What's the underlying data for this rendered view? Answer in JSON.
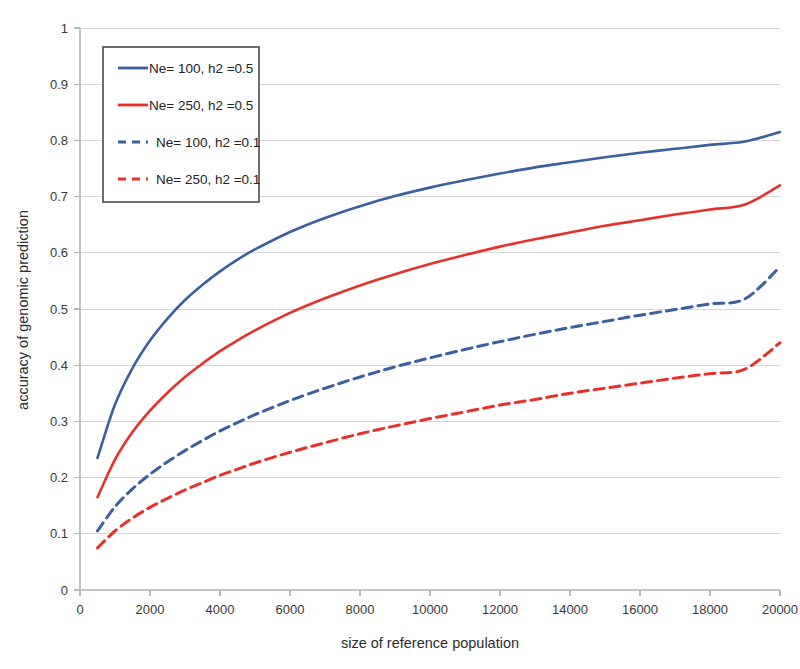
{
  "chart_data": {
    "type": "line",
    "title": "",
    "xlabel": "size of reference population",
    "ylabel": "accuracy of genomic prediction",
    "xlim": [
      0,
      20000
    ],
    "ylim": [
      0,
      1
    ],
    "grid": true,
    "legend_position": "top-left",
    "x_ticks": [
      "0",
      "2000",
      "4000",
      "6000",
      "8000",
      "10000",
      "12000",
      "14000",
      "16000",
      "18000",
      "20000"
    ],
    "y_ticks": [
      "0",
      "0.1",
      "0.2",
      "0.3",
      "0.4",
      "0.5",
      "0.6",
      "0.7",
      "0.8",
      "0.9",
      "1"
    ],
    "x": [
      500,
      1000,
      1500,
      2000,
      2500,
      3000,
      3500,
      4000,
      4500,
      5000,
      6000,
      7000,
      8000,
      9000,
      10000,
      11000,
      12000,
      13000,
      14000,
      15000,
      16000,
      17000,
      18000,
      19000,
      20000
    ],
    "series": [
      {
        "name": "Ne= 100, h2 =0.5",
        "color": "#3c5f9e",
        "style": "solid",
        "values": [
          0.235,
          0.33,
          0.395,
          0.444,
          0.483,
          0.516,
          0.543,
          0.567,
          0.588,
          0.606,
          0.637,
          0.662,
          0.683,
          0.701,
          0.716,
          0.729,
          0.741,
          0.752,
          0.761,
          0.77,
          0.778,
          0.785,
          0.792,
          0.798,
          0.815
        ]
      },
      {
        "name": "Ne= 250, h2 =0.5",
        "color": "#e8302a",
        "style": "solid",
        "values": [
          0.165,
          0.232,
          0.281,
          0.319,
          0.351,
          0.379,
          0.403,
          0.425,
          0.444,
          0.462,
          0.493,
          0.519,
          0.542,
          0.562,
          0.58,
          0.596,
          0.611,
          0.624,
          0.636,
          0.648,
          0.658,
          0.668,
          0.677,
          0.686,
          0.72
        ]
      },
      {
        "name": "Ne= 100, h2 =0.1",
        "color": "#3c5f9e",
        "style": "dashed",
        "values": [
          0.105,
          0.148,
          0.18,
          0.206,
          0.228,
          0.248,
          0.266,
          0.283,
          0.298,
          0.312,
          0.337,
          0.359,
          0.379,
          0.397,
          0.413,
          0.428,
          0.442,
          0.455,
          0.467,
          0.478,
          0.489,
          0.499,
          0.509,
          0.518,
          0.575
        ]
      },
      {
        "name": "Ne= 250, h2 =0.1",
        "color": "#e8302a",
        "style": "dashed",
        "values": [
          0.075,
          0.105,
          0.128,
          0.147,
          0.163,
          0.178,
          0.191,
          0.204,
          0.215,
          0.226,
          0.245,
          0.262,
          0.278,
          0.292,
          0.305,
          0.317,
          0.329,
          0.339,
          0.35,
          0.359,
          0.368,
          0.377,
          0.385,
          0.393,
          0.44
        ]
      }
    ]
  },
  "legend": {
    "items": [
      {
        "label": "Ne= 100, h2 =0.5"
      },
      {
        "label": "Ne= 250, h2 =0.5"
      },
      {
        "label": "Ne= 100, h2 =0.1"
      },
      {
        "label": "Ne= 250, h2 =0.1"
      }
    ]
  },
  "colors": {
    "blue": "#3c5f9e",
    "red": "#e8302a",
    "grid": "#d6d6d6",
    "axis": "#c4c4c4",
    "text": "#2b2b2b"
  }
}
